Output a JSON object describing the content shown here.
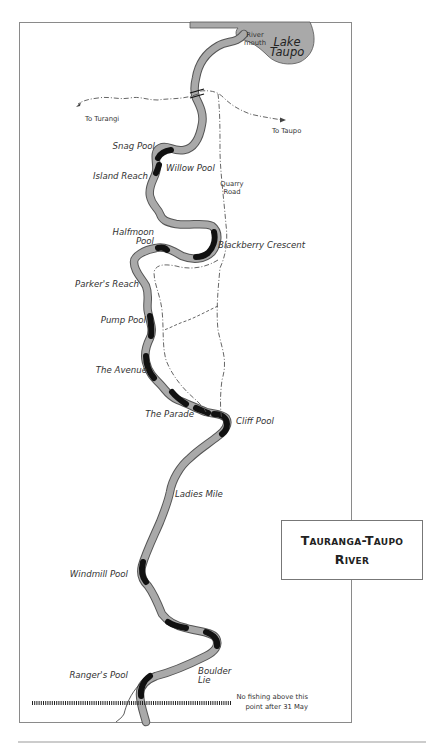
{
  "map": {
    "title_lines": [
      "Tauranga-Taupo",
      "River"
    ],
    "lake": {
      "name_line1": "Lake",
      "name_line2": "Taupo"
    },
    "river_mouth": {
      "line1": "River",
      "line2": "mouth"
    },
    "roads": {
      "to_turangi": "To Turangi",
      "to_taupo": "To Taupo",
      "quarry_road_line1": "Quarry",
      "quarry_road_line2": "Road"
    },
    "pools": [
      {
        "name": "Snag Pool"
      },
      {
        "name": "Willow Pool"
      },
      {
        "name": "Island Reach"
      },
      {
        "name": "Halfmoon",
        "name2": "Pool"
      },
      {
        "name": "Blackberry Crescent"
      },
      {
        "name": "Parker's Reach"
      },
      {
        "name": "Pump Pool"
      },
      {
        "name": "The Avenue"
      },
      {
        "name": "The Parade"
      },
      {
        "name": "Cliff Pool"
      },
      {
        "name": "Ladies Mile"
      },
      {
        "name": "Windmill Pool"
      },
      {
        "name": "Ranger's Pool"
      },
      {
        "name": "Boulder",
        "name2": "Lie"
      }
    ],
    "restriction_note": {
      "line1": "No fishing above this",
      "line2": "point after 31 May"
    },
    "colors": {
      "water": "#a9a9a9",
      "water_outline": "#555555",
      "pool": "#111111",
      "frame": "#8a8a8a"
    }
  }
}
